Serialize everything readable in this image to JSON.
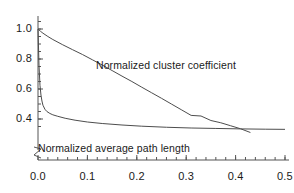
{
  "chart_data": {
    "type": "line",
    "title": "",
    "subtitle": "",
    "xlabel": "",
    "ylabel": "",
    "xlim": [
      0.0,
      0.5
    ],
    "ylim": [
      0.3,
      1.05
    ],
    "grid": false,
    "legend_position": "inline-annotation",
    "axis_break": {
      "axis": "y",
      "symbol": "z-squiggle",
      "note": "y-axis broken below 0.32 near origin"
    },
    "xticks": [
      0.0,
      0.1,
      0.2,
      0.3,
      0.4,
      0.5
    ],
    "xticklabels": [
      "0.0",
      "0.1",
      "0.2",
      "0.3",
      "0.4",
      "0.5"
    ],
    "xminor_tick_step": 0.02,
    "yticks": [
      0.4,
      0.6,
      0.8,
      1.0
    ],
    "yticklabels": [
      "0.4",
      "0.6",
      "0.8",
      "1.0"
    ],
    "yminor_tick_step": 0.05,
    "line_color": "#4d4d4d",
    "axis_color": "#555555",
    "background_color": "#ffffff",
    "series": [
      {
        "name": "Normalized cluster coefficient",
        "annotation": "Normalized cluster coefficient",
        "x": [
          0.0,
          0.005,
          0.01,
          0.02,
          0.03,
          0.05,
          0.07,
          0.09,
          0.11,
          0.13,
          0.15,
          0.17,
          0.19,
          0.21,
          0.23,
          0.25,
          0.27,
          0.29,
          0.31,
          0.33,
          0.35,
          0.37,
          0.39,
          0.41,
          0.43
        ],
        "values": [
          1.0,
          0.985,
          0.972,
          0.95,
          0.93,
          0.895,
          0.862,
          0.83,
          0.795,
          0.76,
          0.723,
          0.686,
          0.65,
          0.612,
          0.575,
          0.538,
          0.5,
          0.462,
          0.424,
          0.42,
          0.39,
          0.375,
          0.355,
          0.335,
          0.31
        ]
      },
      {
        "name": "Normalized average path length",
        "annotation": "Normalized average path length",
        "x": [
          0.0,
          0.002,
          0.004,
          0.006,
          0.008,
          0.01,
          0.014,
          0.018,
          0.024,
          0.03,
          0.04,
          0.055,
          0.075,
          0.1,
          0.13,
          0.17,
          0.21,
          0.26,
          0.31,
          0.36,
          0.41,
          0.46,
          0.5
        ],
        "values": [
          1.0,
          0.76,
          0.625,
          0.56,
          0.52,
          0.492,
          0.465,
          0.45,
          0.437,
          0.428,
          0.418,
          0.405,
          0.392,
          0.38,
          0.37,
          0.36,
          0.352,
          0.345,
          0.34,
          0.337,
          0.334,
          0.332,
          0.331
        ]
      }
    ],
    "crossing_point": {
      "x": 0.32,
      "y": 0.34
    }
  }
}
